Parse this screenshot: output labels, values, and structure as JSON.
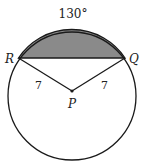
{
  "diagram": {
    "arc_label": "130°",
    "points": {
      "R": "R",
      "Q": "Q",
      "P": "P"
    },
    "radius_labels": [
      "7",
      "7"
    ],
    "colors": {
      "segment_fill": "#8a8a8a",
      "stroke": "#1a1a1a"
    }
  }
}
